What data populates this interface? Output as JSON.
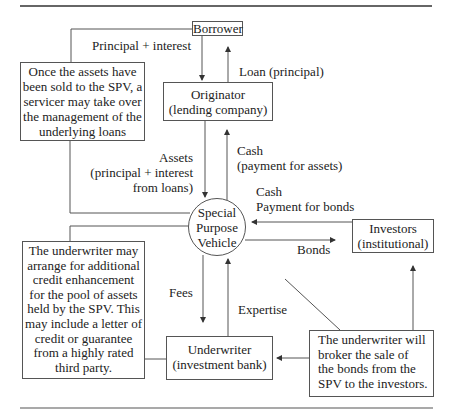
{
  "diagram": {
    "nodes": {
      "borrower": {
        "label": "Borrower"
      },
      "originator": {
        "lines": [
          "Originator",
          "(lending company)"
        ]
      },
      "spv": {
        "lines": [
          "Special",
          "Purpose",
          "Vehicle"
        ]
      },
      "investors": {
        "lines": [
          "Investors",
          "(institutional)"
        ]
      },
      "underwriter": {
        "lines": [
          "Underwriter",
          "(investment bank)"
        ]
      }
    },
    "notes": {
      "servicer": {
        "lines": [
          "Once the assets have",
          "been sold to the SPV, a",
          "servicer may take over",
          "the management of the",
          "underlying loans"
        ]
      },
      "credit_enhancement": {
        "lines": [
          "The underwriter may",
          "arrange for additional",
          "credit enhancement",
          "for the pool of assets",
          "held by the SPV. This",
          "may include a letter of",
          "credit or guarantee",
          "from a highly rated",
          "third party."
        ]
      },
      "broker": {
        "lines": [
          "The underwriter will",
          "broker the sale of",
          "the bonds from the",
          "SPV to the investors."
        ]
      }
    },
    "edge_labels": {
      "principal_interest": "Principal + interest",
      "loan": "Loan (principal)",
      "assets": [
        "Assets",
        "(principal + interest",
        "from loans)"
      ],
      "cash_assets": [
        "Cash",
        "(payment for assets)"
      ],
      "cash_bonds": [
        "Cash",
        "Payment for bonds"
      ],
      "bonds": "Bonds",
      "fees": "Fees",
      "expertise": "Expertise"
    },
    "edges": [
      {
        "from": "Borrower",
        "to": "Originator",
        "label": "Principal + interest"
      },
      {
        "from": "Originator",
        "to": "Borrower",
        "label": "Loan (principal)"
      },
      {
        "from": "Originator",
        "to": "Special Purpose Vehicle",
        "label": "Assets (principal + interest from loans)"
      },
      {
        "from": "Special Purpose Vehicle",
        "to": "Originator",
        "label": "Cash (payment for assets)"
      },
      {
        "from": "Investors",
        "to": "Special Purpose Vehicle",
        "label": "Cash Payment for bonds"
      },
      {
        "from": "Special Purpose Vehicle",
        "to": "Investors",
        "label": "Bonds"
      },
      {
        "from": "Special Purpose Vehicle",
        "to": "Underwriter",
        "label": "Fees"
      },
      {
        "from": "Underwriter",
        "to": "Special Purpose Vehicle",
        "label": "Expertise"
      }
    ]
  }
}
